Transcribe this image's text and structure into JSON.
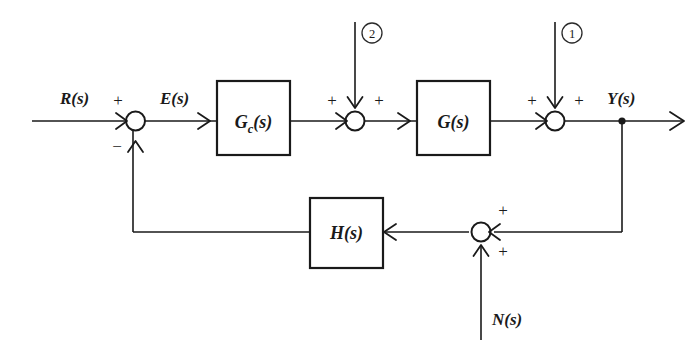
{
  "diagram": {
    "type": "control-block-diagram",
    "colors": {
      "line": "#1a1a1a",
      "background": "#ffffff"
    },
    "blocks": [
      {
        "id": "gc",
        "label": "G",
        "subscript": "c",
        "arg": "(s)",
        "full_label": "G_c(s)"
      },
      {
        "id": "g",
        "label": "G",
        "subscript": "",
        "arg": "(s)",
        "full_label": "G(s)"
      },
      {
        "id": "h",
        "label": "H",
        "subscript": "",
        "arg": "(s)",
        "full_label": "H(s)"
      }
    ],
    "signals": {
      "reference": "R(s)",
      "error": "E(s)",
      "output": "Y(s)",
      "noise": "N(s)"
    },
    "disturbances": [
      {
        "id": "d1",
        "marker": "①",
        "number": "1"
      },
      {
        "id": "d2",
        "marker": "②",
        "number": "2"
      }
    ],
    "summing_junctions": [
      {
        "id": "sum-error",
        "signs": [
          {
            "name": "reference-sign",
            "value": "+"
          },
          {
            "name": "feedback-sign",
            "value": "−"
          }
        ]
      },
      {
        "id": "sum-disturbance-2",
        "signs": [
          {
            "name": "forward-sign",
            "value": "+"
          },
          {
            "name": "disturbance-sign",
            "value": "+"
          }
        ]
      },
      {
        "id": "sum-disturbance-1",
        "signs": [
          {
            "name": "forward-sign",
            "value": "+"
          },
          {
            "name": "disturbance-sign",
            "value": "+"
          }
        ]
      },
      {
        "id": "sum-noise",
        "signs": [
          {
            "name": "output-sign",
            "value": "+"
          },
          {
            "name": "noise-sign",
            "value": "+"
          }
        ]
      }
    ]
  }
}
